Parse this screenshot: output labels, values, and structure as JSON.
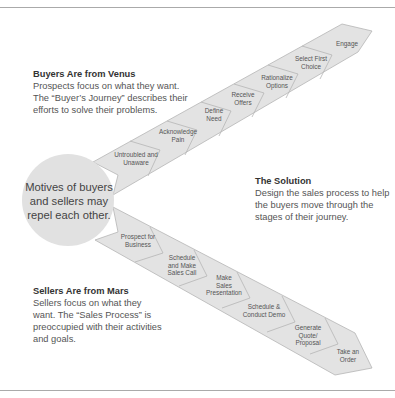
{
  "colors": {
    "band_fill": "#e3e3e3",
    "band_stroke": "#b5b5b5",
    "circle_fill": "#e1e1e1",
    "rule": "#aaaaaa"
  },
  "center": {
    "line1": "Motives of buyers",
    "line2": "and sellers may",
    "line3": "repel each other."
  },
  "buyers": {
    "heading": "Buyers Are from Venus",
    "line1": "Prospects focus on what they want.",
    "line2": "The “Buyer’s Journey” describes their",
    "line3": "efforts to solve their problems.",
    "stages": [
      {
        "lines": [
          "Untroubled and",
          "Unaware"
        ]
      },
      {
        "lines": [
          "Acknowledge",
          "Pain"
        ]
      },
      {
        "lines": [
          "Define",
          "Need"
        ]
      },
      {
        "lines": [
          "Receive",
          "Offers"
        ]
      },
      {
        "lines": [
          "Rationalize",
          "Options"
        ]
      },
      {
        "lines": [
          "Select First",
          "Choice"
        ]
      },
      {
        "lines": [
          "Engage"
        ]
      }
    ]
  },
  "solution": {
    "heading": "The Solution",
    "line1": "Design the sales process to help",
    "line2": "the buyers move through the",
    "line3": "stages of their journey."
  },
  "sellers": {
    "heading": "Sellers Are from Mars",
    "line1": "Sellers focus on what they",
    "line2": "want. The “Sales Process” is",
    "line3": "preoccupied with their activities",
    "line4": "and goals.",
    "stages": [
      {
        "lines": [
          "Prospect for",
          "Business"
        ]
      },
      {
        "lines": [
          "Schedule",
          "and Make",
          "Sales Call"
        ]
      },
      {
        "lines": [
          "Make",
          "Sales",
          "Presentation"
        ]
      },
      {
        "lines": [
          "Schedule &",
          "Conduct Demo"
        ]
      },
      {
        "lines": [
          "Generate",
          "Quote/",
          "Proposal"
        ]
      },
      {
        "lines": [
          "Take an",
          "Order"
        ]
      }
    ]
  }
}
